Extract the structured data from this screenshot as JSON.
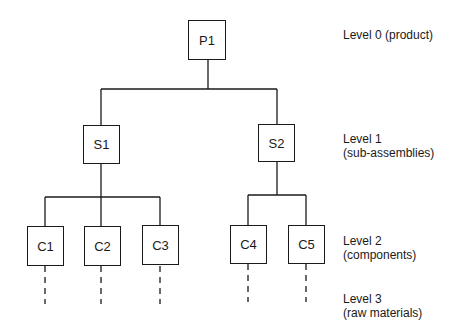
{
  "diagram": {
    "type": "product-structure-tree",
    "nodes": [
      {
        "id": "P1",
        "label": "P1",
        "level": 0
      },
      {
        "id": "S1",
        "label": "S1",
        "level": 1,
        "parent": "P1"
      },
      {
        "id": "S2",
        "label": "S2",
        "level": 1,
        "parent": "P1"
      },
      {
        "id": "C1",
        "label": "C1",
        "level": 2,
        "parent": "S1"
      },
      {
        "id": "C2",
        "label": "C2",
        "level": 2,
        "parent": "S1"
      },
      {
        "id": "C3",
        "label": "C3",
        "level": 2,
        "parent": "S1"
      },
      {
        "id": "C4",
        "label": "C4",
        "level": 2,
        "parent": "S2"
      },
      {
        "id": "C5",
        "label": "C5",
        "level": 2,
        "parent": "S2"
      }
    ],
    "levels": [
      {
        "line1": "Level 0 (product)",
        "line2": ""
      },
      {
        "line1": "Level 1",
        "line2": "(sub-assemblies)"
      },
      {
        "line1": "Level 2",
        "line2": "(components)"
      },
      {
        "line1": "Level 3",
        "line2": "(raw materials)"
      }
    ]
  }
}
